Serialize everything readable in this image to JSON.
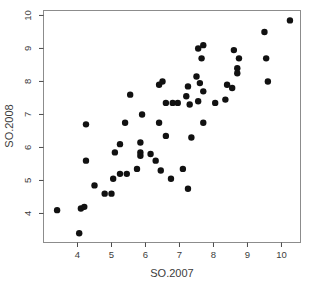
{
  "chart_data": {
    "type": "scatter",
    "title": "",
    "xlabel": "SO.2007",
    "ylabel": "SO.2008",
    "xlim": [
      3.0,
      10.56
    ],
    "ylim": [
      3.12,
      10.15
    ],
    "x_ticks": [
      4,
      5,
      6,
      7,
      8,
      9,
      10
    ],
    "y_ticks": [
      4,
      5,
      6,
      7,
      8,
      9,
      10
    ],
    "grid": false,
    "legend": null,
    "marker": {
      "shape": "filled-circle",
      "color": "#111111",
      "radius_px": 3.2
    },
    "box_color": "#8c8c8c",
    "tick_color": "#4a4a4a",
    "text_color": "#3c3c3c",
    "points": [
      [
        3.4,
        4.1
      ],
      [
        4.05,
        3.4
      ],
      [
        4.1,
        4.15
      ],
      [
        4.2,
        4.2
      ],
      [
        4.25,
        5.6
      ],
      [
        4.25,
        6.7
      ],
      [
        4.5,
        4.85
      ],
      [
        4.8,
        4.6
      ],
      [
        5.0,
        4.6
      ],
      [
        5.05,
        5.05
      ],
      [
        5.25,
        5.2
      ],
      [
        5.45,
        5.2
      ],
      [
        5.75,
        5.35
      ],
      [
        5.1,
        5.85
      ],
      [
        5.25,
        6.1
      ],
      [
        5.85,
        6.15
      ],
      [
        5.85,
        5.85
      ],
      [
        5.85,
        5.75
      ],
      [
        6.15,
        5.8
      ],
      [
        6.3,
        5.6
      ],
      [
        5.4,
        6.75
      ],
      [
        5.55,
        7.6
      ],
      [
        5.9,
        7.0
      ],
      [
        6.4,
        6.75
      ],
      [
        6.6,
        6.35
      ],
      [
        6.6,
        7.35
      ],
      [
        6.8,
        7.35
      ],
      [
        6.95,
        7.35
      ],
      [
        7.3,
        7.3
      ],
      [
        7.55,
        7.4
      ],
      [
        7.35,
        6.3
      ],
      [
        7.7,
        6.75
      ],
      [
        8.05,
        7.35
      ],
      [
        8.35,
        7.45
      ],
      [
        6.45,
        5.3
      ],
      [
        6.75,
        5.05
      ],
      [
        7.1,
        5.35
      ],
      [
        7.25,
        4.75
      ],
      [
        6.4,
        7.9
      ],
      [
        6.5,
        8.0
      ],
      [
        7.25,
        7.85
      ],
      [
        7.6,
        7.95
      ],
      [
        7.7,
        7.7
      ],
      [
        7.2,
        7.55
      ],
      [
        7.55,
        9.0
      ],
      [
        7.7,
        9.1
      ],
      [
        7.65,
        8.7
      ],
      [
        7.5,
        8.15
      ],
      [
        10.25,
        9.85
      ],
      [
        9.5,
        9.5
      ],
      [
        8.6,
        8.95
      ],
      [
        8.75,
        8.7
      ],
      [
        9.55,
        8.7
      ],
      [
        8.7,
        8.4
      ],
      [
        8.7,
        8.25
      ],
      [
        8.4,
        7.9
      ],
      [
        8.55,
        7.8
      ],
      [
        9.6,
        8.0
      ]
    ]
  }
}
